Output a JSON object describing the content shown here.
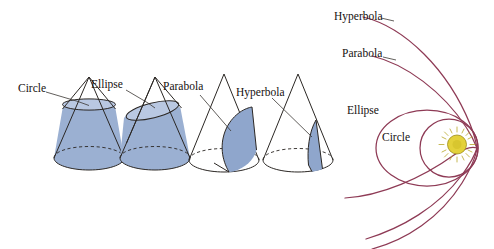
{
  "figure": {
    "background_color": "#ffffff",
    "cone_fill_color": "#9bb0d2",
    "cone_outline_color": "#2b2724",
    "orbit_color": "#8e3a55",
    "sun_color": "#e3d13a"
  },
  "cones": [
    {
      "label": "Circle",
      "description": "Right circular cone cut by a plane perpendicular to the axis, producing a circle",
      "label_x": 18,
      "label_y": 92,
      "cut_type": "horizontal"
    },
    {
      "label": "Ellipse",
      "description": "Cone cut by an oblique plane producing an ellipse",
      "label_x": 95,
      "label_y": 88,
      "cut_type": "oblique"
    },
    {
      "label": "Parabola",
      "description": "Cone cut by a plane parallel to a slant edge producing a parabola",
      "label_x": 167,
      "label_y": 90,
      "cut_type": "parallel-to-slant"
    },
    {
      "label": "Hyperbola",
      "description": "Cone cut by a plane parallel to the axis producing a hyperbola",
      "label_x": 240,
      "label_y": 96,
      "cut_type": "parallel-to-axis"
    }
  ],
  "orbits": {
    "focus_label": "Sun",
    "paths": [
      {
        "label": "Hyperbola",
        "label_x": 334,
        "label_y": 20,
        "eccentricity_class": "e > 1"
      },
      {
        "label": "Parabola",
        "label_x": 342,
        "label_y": 57,
        "eccentricity_class": "e = 1"
      },
      {
        "label": "Ellipse",
        "label_x": 347,
        "label_y": 114,
        "eccentricity_class": "0 < e < 1"
      },
      {
        "label": "Circle",
        "label_x": 382,
        "label_y": 141,
        "eccentricity_class": "e = 0"
      }
    ]
  }
}
